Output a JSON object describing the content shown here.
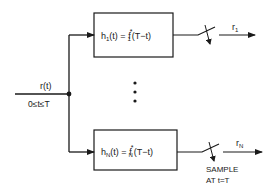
{
  "diagram": {
    "type": "matched-filter-bank",
    "input": {
      "signal_label": "r(t)",
      "range_label": "0≤t≤T"
    },
    "filters": [
      {
        "name": "h",
        "index": "1",
        "lhs_arg": "(t) = ",
        "rhs_func": "f",
        "rhs_sup": "*",
        "rhs_sub": "1",
        "rhs_arg": "(T−t)",
        "output_symbol": "r",
        "output_index": "1"
      },
      {
        "name": "h",
        "index": "N",
        "lhs_arg": "(t) = ",
        "rhs_func": "f",
        "rhs_sup": "*",
        "rhs_sub": "N",
        "rhs_arg": "(T−t)",
        "output_symbol": "r",
        "output_index": "N"
      }
    ],
    "ellipsis": "⋮",
    "sampler": {
      "line1": "SAMPLE",
      "line2": "AT t=T"
    }
  }
}
